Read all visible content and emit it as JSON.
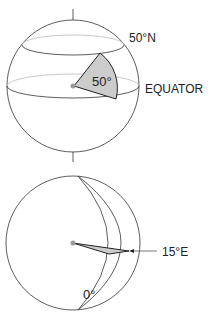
{
  "figure": {
    "top_panel": {
      "labels": {
        "parallel": "50°N",
        "equator": "EQUATOR",
        "angle": "50°"
      }
    },
    "bottom_panel": {
      "labels": {
        "meridian_prime": "0°",
        "meridian_east": "15°E"
      }
    },
    "colors": {
      "line": "#333333",
      "back_line": "#bbbbbb",
      "sector_fill": "#cccccc",
      "center_dot": "#999999"
    }
  }
}
